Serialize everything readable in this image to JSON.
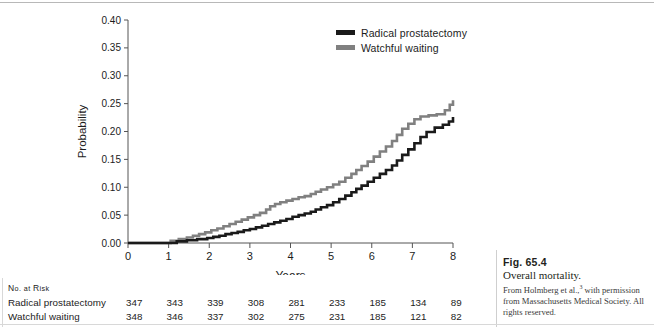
{
  "figure": {
    "number_label": "Fig. 65.4",
    "title": "Overall mortality.",
    "credit_before": "From Holmberg et al.,",
    "credit_superscript": "3",
    "credit_after": " with permission from Massachusetts Medical Society. All rights reserved."
  },
  "legend": {
    "position": "top-right",
    "items": [
      {
        "label": "Radical prostatectomy",
        "color": "#1a1a1a"
      },
      {
        "label": "Watchful waiting",
        "color": "#808080"
      }
    ]
  },
  "risk_table": {
    "title": "No. at Risk",
    "title_parts": {
      "a": "N",
      "b": "o.",
      "c": " at ",
      "d": "R",
      "e": "isk"
    },
    "rows": [
      {
        "label": "Radical prostatectomy",
        "values": [
          347,
          343,
          339,
          308,
          281,
          233,
          185,
          134,
          89
        ]
      },
      {
        "label": "Watchful waiting",
        "values": [
          348,
          346,
          337,
          302,
          275,
          231,
          185,
          121,
          82
        ]
      }
    ]
  },
  "chart_data": {
    "type": "line",
    "subtype": "kaplan-meier-step",
    "title": "",
    "xlabel": "Years",
    "ylabel": "Probability",
    "xlim": [
      0,
      8
    ],
    "ylim": [
      0,
      0.4
    ],
    "xticks": [
      0,
      1,
      2,
      3,
      4,
      5,
      6,
      7,
      8
    ],
    "xticklabels": [
      "0",
      "1",
      "2",
      "3",
      "4",
      "5",
      "6",
      "7",
      "8"
    ],
    "yticks": [
      0.0,
      0.05,
      0.1,
      0.15,
      0.2,
      0.25,
      0.3,
      0.35,
      0.4
    ],
    "yticklabels": [
      "0.00",
      "0.05",
      "0.10",
      "0.15",
      "0.20",
      "0.25",
      "0.30",
      "0.35",
      "0.40"
    ],
    "grid": false,
    "legend_position": "top-right",
    "series": [
      {
        "name": "Radical prostatectomy",
        "color": "#1a1a1a",
        "linewidth": 2.6,
        "x": [
          0.0,
          0.95,
          1.2,
          1.45,
          1.7,
          1.95,
          2.1,
          2.25,
          2.4,
          2.55,
          2.7,
          2.85,
          3.0,
          3.15,
          3.3,
          3.45,
          3.6,
          3.75,
          3.9,
          4.05,
          4.2,
          4.35,
          4.5,
          4.62,
          4.75,
          4.9,
          5.05,
          5.2,
          5.35,
          5.5,
          5.62,
          5.75,
          5.9,
          6.05,
          6.2,
          6.35,
          6.5,
          6.62,
          6.75,
          6.9,
          7.05,
          7.2,
          7.35,
          7.55,
          7.75,
          7.9,
          8.0
        ],
        "y": [
          0.0,
          0.0,
          0.003,
          0.005,
          0.007,
          0.009,
          0.011,
          0.013,
          0.016,
          0.018,
          0.02,
          0.023,
          0.025,
          0.028,
          0.031,
          0.034,
          0.037,
          0.04,
          0.043,
          0.047,
          0.05,
          0.053,
          0.056,
          0.06,
          0.064,
          0.068,
          0.073,
          0.079,
          0.085,
          0.091,
          0.097,
          0.103,
          0.11,
          0.117,
          0.124,
          0.131,
          0.139,
          0.148,
          0.158,
          0.168,
          0.179,
          0.19,
          0.199,
          0.207,
          0.212,
          0.218,
          0.226
        ]
      },
      {
        "name": "Watchful waiting",
        "color": "#808080",
        "linewidth": 2.6,
        "x": [
          0.0,
          0.85,
          1.05,
          1.25,
          1.45,
          1.6,
          1.75,
          1.9,
          2.05,
          2.2,
          2.35,
          2.5,
          2.65,
          2.8,
          2.95,
          3.1,
          3.25,
          3.4,
          3.5,
          3.62,
          3.75,
          3.9,
          4.05,
          4.2,
          4.35,
          4.5,
          4.62,
          4.75,
          4.9,
          5.05,
          5.2,
          5.35,
          5.5,
          5.62,
          5.75,
          5.9,
          6.05,
          6.2,
          6.35,
          6.5,
          6.62,
          6.75,
          6.9,
          7.05,
          7.2,
          7.4,
          7.6,
          7.8,
          7.92,
          8.0
        ],
        "y": [
          0.0,
          0.0,
          0.004,
          0.007,
          0.01,
          0.013,
          0.016,
          0.019,
          0.023,
          0.026,
          0.03,
          0.034,
          0.038,
          0.042,
          0.046,
          0.05,
          0.054,
          0.06,
          0.066,
          0.07,
          0.073,
          0.076,
          0.079,
          0.082,
          0.084,
          0.088,
          0.092,
          0.096,
          0.1,
          0.105,
          0.11,
          0.117,
          0.124,
          0.131,
          0.138,
          0.146,
          0.155,
          0.164,
          0.173,
          0.183,
          0.194,
          0.205,
          0.214,
          0.222,
          0.227,
          0.229,
          0.231,
          0.238,
          0.248,
          0.256
        ]
      }
    ]
  }
}
